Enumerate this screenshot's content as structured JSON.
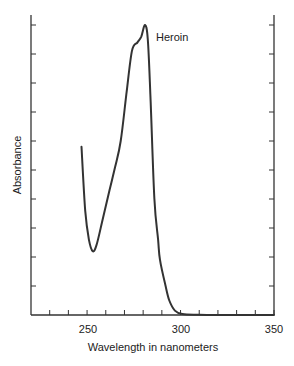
{
  "chart_data": {
    "type": "line",
    "title": "",
    "xlabel": "Wavelength in nanometers",
    "ylabel": "Absorbance",
    "xlim": [
      220,
      350
    ],
    "ylim": [
      0,
      10
    ],
    "x_tick_labels": [
      "250",
      "300",
      "350"
    ],
    "x_ticks": [
      230,
      240,
      250,
      260,
      270,
      280,
      290,
      300,
      310,
      320,
      330,
      340,
      350
    ],
    "y_ticks": [
      1,
      2,
      3,
      4,
      5,
      6,
      7,
      8,
      9,
      10
    ],
    "y_tick_labels": [],
    "grid": false,
    "annotations": [
      {
        "text": "Heroin",
        "x": 285,
        "y": 9.6
      }
    ],
    "series": [
      {
        "name": "Heroin",
        "color": "#333333",
        "x": [
          247,
          249,
          251,
          253,
          255,
          258,
          262,
          265,
          268,
          271,
          274,
          277,
          279,
          281,
          282.5,
          284,
          286,
          288,
          289,
          292,
          294,
          297,
          301,
          310,
          330,
          350
        ],
        "y": [
          5.8,
          3.6,
          2.6,
          2.2,
          2.4,
          3.2,
          4.3,
          5.1,
          6.0,
          7.6,
          9.1,
          9.4,
          9.6,
          10.0,
          9.5,
          7.4,
          4.0,
          2.6,
          1.9,
          1.0,
          0.5,
          0.15,
          0.03,
          0.01,
          0.0,
          0.0
        ]
      }
    ]
  },
  "labels": {
    "xlabel": "Wavelength in nanometers",
    "ylabel": "Absorbance",
    "series_label": "Heroin",
    "tick_250": "250",
    "tick_300": "300",
    "tick_350": "350"
  }
}
